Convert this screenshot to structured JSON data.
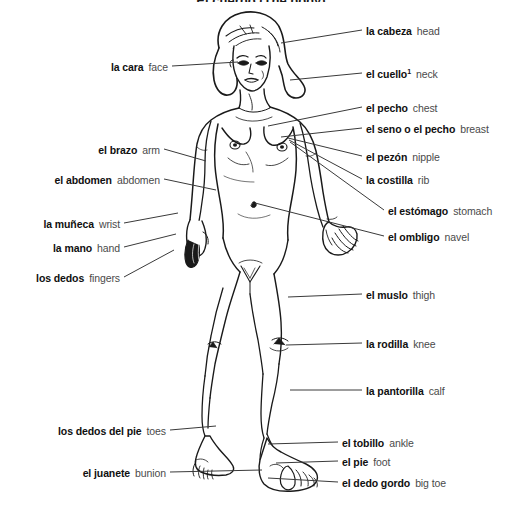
{
  "page": {
    "title": "El cuerpo (The body)",
    "background_color": "#ffffff",
    "term_color": "#101010",
    "gloss_color": "#4a4a4a",
    "line_color": "#3a3a3a",
    "width": 522,
    "height": 506
  },
  "labels_left": [
    {
      "term": "la cara",
      "gloss": "face",
      "x_right": 168,
      "y": 67,
      "line": {
        "x1": 172,
        "y1": 66,
        "x2": 238,
        "y2": 62
      }
    },
    {
      "term": "el brazo",
      "gloss": "arm",
      "x_right": 160,
      "y": 150,
      "line": {
        "x1": 164,
        "y1": 149,
        "x2": 206,
        "y2": 161
      }
    },
    {
      "term": "el abdomen",
      "gloss": "abdomen",
      "x_right": 160,
      "y": 180,
      "line": {
        "x1": 164,
        "y1": 179,
        "x2": 216,
        "y2": 190
      }
    },
    {
      "term": "la muñeca",
      "gloss": "wrist",
      "x_right": 120,
      "y": 224,
      "line": {
        "x1": 124,
        "y1": 223,
        "x2": 178,
        "y2": 213
      }
    },
    {
      "term": "la mano",
      "gloss": "hand",
      "x_right": 120,
      "y": 248,
      "line": {
        "x1": 124,
        "y1": 247,
        "x2": 176,
        "y2": 234
      }
    },
    {
      "term": "los dedos",
      "gloss": "fingers",
      "x_right": 120,
      "y": 278,
      "line": {
        "x1": 124,
        "y1": 277,
        "x2": 174,
        "y2": 250
      }
    },
    {
      "term": "los dedos del pie",
      "gloss": "toes",
      "x_right": 166,
      "y": 431,
      "line": {
        "x1": 170,
        "y1": 430,
        "x2": 216,
        "y2": 426
      }
    },
    {
      "term": "el juanete",
      "gloss": "bunion",
      "x_right": 166,
      "y": 473,
      "line": {
        "x1": 170,
        "y1": 472,
        "x2": 262,
        "y2": 470
      }
    }
  ],
  "labels_right": [
    {
      "term": "la cabeza",
      "gloss": "head",
      "x_left": 366,
      "y": 31,
      "line": {
        "x1": 362,
        "y1": 30,
        "x2": 281,
        "y2": 43
      }
    },
    {
      "term": "el cuello",
      "gloss": "neck",
      "x_left": 366,
      "y": 74,
      "footnote": "1",
      "line": {
        "x1": 362,
        "y1": 73,
        "x2": 290,
        "y2": 80
      }
    },
    {
      "term": "el pecho",
      "gloss": "chest",
      "x_left": 366,
      "y": 108,
      "line": {
        "x1": 362,
        "y1": 107,
        "x2": 268,
        "y2": 126
      }
    },
    {
      "term": "el seno o el pecho",
      "gloss": "breast",
      "x_left": 366,
      "y": 129,
      "line": {
        "x1": 362,
        "y1": 128,
        "x2": 281,
        "y2": 137
      }
    },
    {
      "term": "el pezón",
      "gloss": "nipple",
      "x_left": 366,
      "y": 157,
      "line": {
        "x1": 362,
        "y1": 156,
        "x2": 288,
        "y2": 138
      }
    },
    {
      "term": "la costilla",
      "gloss": "rib",
      "x_left": 366,
      "y": 180,
      "line": {
        "x1": 362,
        "y1": 179,
        "x2": 289,
        "y2": 140
      }
    },
    {
      "term": "el estómago",
      "gloss": "stomach",
      "x_left": 388,
      "y": 211,
      "line": {
        "x1": 384,
        "y1": 210,
        "x2": 290,
        "y2": 142
      }
    },
    {
      "term": "el ombligo",
      "gloss": "navel",
      "x_left": 388,
      "y": 237,
      "line": {
        "x1": 384,
        "y1": 236,
        "x2": 255,
        "y2": 203
      }
    },
    {
      "term": "el muslo",
      "gloss": "thigh",
      "x_left": 366,
      "y": 295,
      "line": {
        "x1": 362,
        "y1": 294,
        "x2": 288,
        "y2": 297
      }
    },
    {
      "term": "la rodilla",
      "gloss": "knee",
      "x_left": 366,
      "y": 344,
      "line": {
        "x1": 362,
        "y1": 343,
        "x2": 286,
        "y2": 345
      }
    },
    {
      "term": "la pantorilla",
      "gloss": "calf",
      "x_left": 366,
      "y": 391,
      "line": {
        "x1": 362,
        "y1": 390,
        "x2": 290,
        "y2": 390
      }
    },
    {
      "term": "el tobillo",
      "gloss": "ankle",
      "x_left": 342,
      "y": 443,
      "line": {
        "x1": 338,
        "y1": 442,
        "x2": 268,
        "y2": 444
      }
    },
    {
      "term": "el pie",
      "gloss": "foot",
      "x_left": 342,
      "y": 462,
      "line": {
        "x1": 338,
        "y1": 461,
        "x2": 276,
        "y2": 463
      }
    },
    {
      "term": "el dedo gordo",
      "gloss": "big toe",
      "x_left": 342,
      "y": 483,
      "line": {
        "x1": 338,
        "y1": 482,
        "x2": 268,
        "y2": 478
      }
    }
  ]
}
